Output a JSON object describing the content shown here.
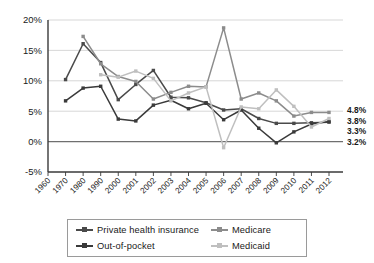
{
  "chart_data": {
    "type": "line",
    "title": "",
    "subtitle": "",
    "xlabel": "",
    "ylabel": "",
    "grid": true,
    "legend_position": "bottom",
    "categories": [
      "1960",
      "1970",
      "1980",
      "1990",
      "2000",
      "2001",
      "2002",
      "2003",
      "2004",
      "2005",
      "2006",
      "2007",
      "2008",
      "2009",
      "2010",
      "2011",
      "2012"
    ],
    "ylim": [
      -5,
      20
    ],
    "yticks": [
      "-5%",
      "0%",
      "5%",
      "10%",
      "15%",
      "20%"
    ],
    "ytick_values": [
      -5,
      0,
      5,
      10,
      15,
      20
    ],
    "series": [
      {
        "name": "Private health insurance",
        "color": "#4a4a4a",
        "end_label": "3.2%",
        "values": [
          null,
          10.2,
          16.1,
          13.0,
          6.9,
          9.4,
          11.7,
          7.3,
          7.2,
          6.4,
          5.2,
          5.4,
          3.8,
          3.0,
          3.0,
          3.1,
          3.2
        ]
      },
      {
        "name": "Out-of-pocket",
        "color": "#3a3a3a",
        "end_label": "3.3%",
        "values": [
          null,
          6.7,
          8.8,
          9.1,
          3.7,
          3.4,
          6.0,
          6.8,
          5.4,
          6.3,
          3.6,
          5.2,
          2.2,
          -0.2,
          1.6,
          2.9,
          3.3
        ]
      },
      {
        "name": "Medicare",
        "color": "#8c8c8c",
        "end_label": "4.8%",
        "values": [
          null,
          null,
          17.3,
          12.8,
          10.7,
          9.9,
          7.0,
          8.1,
          9.1,
          9.0,
          18.7,
          7.0,
          8.0,
          6.7,
          4.2,
          4.8,
          4.8
        ]
      },
      {
        "name": "Medicaid",
        "color": "#bfbfbf",
        "end_label": "3.8%",
        "values": [
          null,
          null,
          null,
          11.0,
          10.6,
          11.6,
          10.4,
          6.7,
          8.0,
          9.0,
          -1.0,
          5.7,
          5.4,
          8.5,
          5.8,
          2.4,
          3.8
        ]
      }
    ]
  },
  "legend": {
    "items": [
      {
        "label": "Private health insurance",
        "color": "#4a4a4a"
      },
      {
        "label": "Medicare",
        "color": "#8c8c8c"
      },
      {
        "label": "Out-of-pocket",
        "color": "#3a3a3a"
      },
      {
        "label": "Medicaid",
        "color": "#bfbfbf"
      }
    ]
  }
}
